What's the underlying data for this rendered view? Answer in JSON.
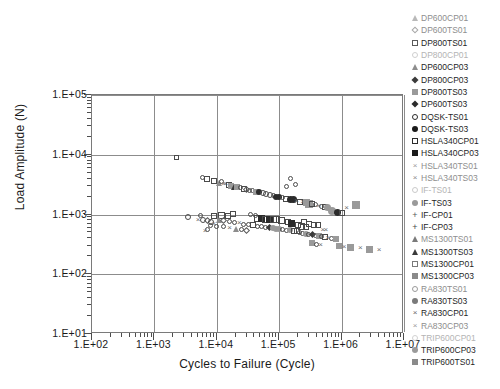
{
  "chart_data": {
    "type": "scatter",
    "title": "",
    "xlabel": "Cycles to Failure (Cycle)",
    "ylabel": "Load Amplitude (N)",
    "xscale": "log",
    "yscale": "log",
    "xlim": [
      100,
      10000000
    ],
    "ylim": [
      10,
      100000
    ],
    "xticks": [
      "1.E+02",
      "1.E+03",
      "1.E+04",
      "1.E+05",
      "1.E+06",
      "1.E+07"
    ],
    "yticks": [
      "1.E+01",
      "1.E+02",
      "1.E+03",
      "1.E+04",
      "1.E+05"
    ],
    "grid": true,
    "legend_position": "right-outside",
    "series": [
      {
        "name": "DP600CP01",
        "marker": "triangle-open",
        "color": "#b9b9b9"
      },
      {
        "name": "DP600TS01",
        "marker": "diamond-open",
        "color": "#a8a8a8"
      },
      {
        "name": "DP800TS01",
        "marker": "square-open",
        "color": "#5a5a5a"
      },
      {
        "name": "DP800CP01",
        "marker": "circle-open",
        "color": "#cfcfcf"
      },
      {
        "name": "DP600CP03",
        "marker": "triangle-filled",
        "color": "#8d8d8d"
      },
      {
        "name": "DP800CP03",
        "marker": "diamond-filled",
        "color": "#3a3a3a"
      },
      {
        "name": "DP800TS03",
        "marker": "square-gray",
        "color": "#9a9a9a"
      },
      {
        "name": "DP600TS03",
        "marker": "diamond-filled",
        "color": "#2b2b2b"
      },
      {
        "name": "DQSK-TS01",
        "marker": "circle-open",
        "color": "#2b2b2b"
      },
      {
        "name": "DQSK-TS03",
        "marker": "circle-filled",
        "color": "#1a1a1a"
      },
      {
        "name": "HSLA340CP01",
        "marker": "square-open",
        "color": "#2b2b2b"
      },
      {
        "name": "HSLA340CP03",
        "marker": "square-filled",
        "color": "#1a1a1a"
      },
      {
        "name": "HSLA340TS01",
        "marker": "x-mark",
        "color": "#9a9a9a"
      },
      {
        "name": "HSLA340TS03",
        "marker": "x-mark",
        "color": "#8a8a8a"
      },
      {
        "name": "IF-TS01",
        "marker": "circle-open",
        "color": "#cacaca"
      },
      {
        "name": "IF-TS03",
        "marker": "circle-gray",
        "color": "#9a9a9a"
      },
      {
        "name": "IF-CP01",
        "marker": "plus-mark",
        "color": "#5a5a5a"
      },
      {
        "name": "IF-CP03",
        "marker": "plus-mark",
        "color": "#4a4a4a"
      },
      {
        "name": "MS1300TS01",
        "marker": "triangle-open",
        "color": "#7a7a7a"
      },
      {
        "name": "MS1300TS03",
        "marker": "triangle-filled",
        "color": "#3a3a3a"
      },
      {
        "name": "MS1300CP01",
        "marker": "square-open",
        "color": "#7a7a7a"
      },
      {
        "name": "MS1300CP03",
        "marker": "square-gray",
        "color": "#8a8a8a"
      },
      {
        "name": "RA830TS01",
        "marker": "circle-open",
        "color": "#9a9a9a"
      },
      {
        "name": "RA830TS03",
        "marker": "circle-gray",
        "color": "#7a7a7a"
      },
      {
        "name": "RA830CP01",
        "marker": "x-mark",
        "color": "#6a6a6a"
      },
      {
        "name": "RA830CP03",
        "marker": "x-mark",
        "color": "#9a9a9a"
      },
      {
        "name": "TRIP600CP01",
        "marker": "circle-open",
        "color": "#d2d2d2"
      },
      {
        "name": "TRIP600CP03",
        "marker": "circle-gray",
        "color": "#9a9a9a"
      },
      {
        "name": "TRIP600TS01",
        "marker": "square-gray",
        "color": "#8a8a8a"
      }
    ],
    "clusters": [
      {
        "note": "upper band",
        "x_from": 3000,
        "x_to": 2000000,
        "y_from": 5000,
        "y_to": 900
      },
      {
        "note": "lower band",
        "x_from": 3000,
        "x_to": 7000000,
        "y_from": 900,
        "y_to": 90
      }
    ],
    "points": [
      [
        2300,
        9000,
        "m-sq-o",
        5
      ],
      [
        6000,
        4200,
        "m-ci-o",
        5
      ],
      [
        7000,
        4000,
        "m-sq-o",
        6
      ],
      [
        9000,
        3600,
        "m-sq-o",
        6
      ],
      [
        11000,
        3400,
        "m-tr-o",
        6
      ],
      [
        12000,
        3500,
        "m-ci-o",
        5
      ],
      [
        13000,
        3300,
        "m-x",
        6
      ],
      [
        14000,
        3200,
        "m-x",
        6
      ],
      [
        15500,
        3100,
        "m-sq-o",
        6
      ],
      [
        17000,
        3000,
        "m-sq-g",
        6
      ],
      [
        19000,
        2900,
        "m-tr-f",
        6
      ],
      [
        21000,
        2850,
        "m-sq-g",
        6
      ],
      [
        24000,
        2800,
        "m-ci-o",
        5
      ],
      [
        27000,
        2700,
        "m-sq-o",
        6
      ],
      [
        30000,
        2600,
        "m-di-o",
        5
      ],
      [
        34000,
        2550,
        "m-ci-o",
        5
      ],
      [
        38000,
        2500,
        "m-ci-o",
        5
      ],
      [
        43000,
        2400,
        "m-sq-g",
        6
      ],
      [
        48000,
        2350,
        "m-ci-f",
        6
      ],
      [
        55000,
        2300,
        "m-ci-o",
        6
      ],
      [
        62000,
        2200,
        "m-ci-o",
        6
      ],
      [
        70000,
        2150,
        "m-ci-o",
        6
      ],
      [
        80000,
        2050,
        "m-ci-o",
        5
      ],
      [
        90000,
        2000,
        "m-ci-f",
        6
      ],
      [
        100000,
        1950,
        "m-ci-f",
        6
      ],
      [
        115000,
        1900,
        "m-ci-o",
        5
      ],
      [
        130000,
        1850,
        "m-sq-o",
        6
      ],
      [
        150000,
        1800,
        "m-ci-f",
        7
      ],
      [
        170000,
        1750,
        "m-ci-f",
        7
      ],
      [
        190000,
        1700,
        "m-x",
        6
      ],
      [
        215000,
        1650,
        "m-sq-o",
        6
      ],
      [
        240000,
        1600,
        "m-x",
        6
      ],
      [
        270000,
        1580,
        "m-sq-g",
        7
      ],
      [
        300000,
        1520,
        "m-sq-g",
        8
      ],
      [
        340000,
        1480,
        "m-sq-o",
        6
      ],
      [
        380000,
        1450,
        "m-ci-o",
        5
      ],
      [
        430000,
        1400,
        "m-x",
        6
      ],
      [
        480000,
        1380,
        "m-ci-o",
        5
      ],
      [
        540000,
        1340,
        "m-sq-o",
        6
      ],
      [
        600000,
        1300,
        "m-ci-g",
        7
      ],
      [
        700000,
        1150,
        "m-ci-g",
        8
      ],
      [
        850000,
        1080,
        "m-ci-f",
        7
      ],
      [
        1000000,
        1040,
        "m-sq-o",
        6
      ],
      [
        1200000,
        1300,
        "m-x",
        6
      ],
      [
        1700000,
        1450,
        "m-sq-g",
        8
      ],
      [
        3500,
        900,
        "m-ci-o",
        6
      ],
      [
        5000,
        820,
        "m-x",
        6
      ],
      [
        6000,
        800,
        "m-ci-o",
        6
      ],
      [
        7000,
        780,
        "m-di-o",
        5
      ],
      [
        8000,
        760,
        "m-ci-o",
        6
      ],
      [
        9000,
        700,
        "m-x",
        6
      ],
      [
        5500,
        980,
        "m-ci-o",
        5
      ],
      [
        9000,
        950,
        "m-sq-o",
        6
      ],
      [
        12000,
        960,
        "m-sq-o",
        7
      ],
      [
        15000,
        950,
        "m-sq-o",
        6
      ],
      [
        11000,
        820,
        "m-tr-o",
        6
      ],
      [
        13000,
        800,
        "m-di-o",
        5
      ],
      [
        16000,
        760,
        "m-ci-o",
        5
      ],
      [
        19000,
        740,
        "m-ci-o",
        5
      ],
      [
        23000,
        700,
        "m-x",
        7
      ],
      [
        27000,
        690,
        "m-ci-o",
        5
      ],
      [
        32000,
        670,
        "m-ci-o",
        5
      ],
      [
        38000,
        660,
        "m-sq-o",
        6
      ],
      [
        45000,
        870,
        "m-sq-o",
        7
      ],
      [
        52000,
        850,
        "m-sq-f",
        7
      ],
      [
        60000,
        840,
        "m-sq-o",
        7
      ],
      [
        70000,
        830,
        "m-sq-f",
        7
      ],
      [
        80000,
        820,
        "m-sq-o",
        7
      ],
      [
        90000,
        810,
        "m-sq-o",
        7
      ],
      [
        45000,
        640,
        "m-ci-o",
        5
      ],
      [
        52000,
        620,
        "m-ci-o",
        5
      ],
      [
        60000,
        610,
        "m-ci-o",
        5
      ],
      [
        70000,
        600,
        "m-di-f",
        5
      ],
      [
        80000,
        590,
        "m-ci-g",
        6
      ],
      [
        90000,
        580,
        "m-ci-g",
        6
      ],
      [
        100000,
        570,
        "m-ci-g",
        6
      ],
      [
        115000,
        560,
        "m-ci-o",
        5
      ],
      [
        130000,
        550,
        "m-ci-o",
        5
      ],
      [
        150000,
        540,
        "m-ci-g",
        6
      ],
      [
        170000,
        530,
        "m-sq-o",
        6
      ],
      [
        190000,
        520,
        "m-sq-o",
        6
      ],
      [
        110000,
        790,
        "m-sq-o",
        7
      ],
      [
        140000,
        760,
        "m-sq-o",
        6
      ],
      [
        160000,
        700,
        "m-sq-f",
        7
      ],
      [
        200000,
        660,
        "m-sq-o",
        6
      ],
      [
        230000,
        640,
        "m-sq-o",
        7
      ],
      [
        270000,
        620,
        "m-sq-o",
        6
      ],
      [
        215000,
        500,
        "m-ci-o",
        5
      ],
      [
        240000,
        490,
        "m-ci-o",
        5
      ],
      [
        270000,
        480,
        "m-ci-g",
        6
      ],
      [
        300000,
        470,
        "m-ci-o",
        5
      ],
      [
        340000,
        460,
        "m-di-f",
        5
      ],
      [
        380000,
        450,
        "m-ci-o",
        5
      ],
      [
        430000,
        440,
        "m-sq-g",
        6
      ],
      [
        480000,
        430,
        "m-ci-o",
        5
      ],
      [
        540000,
        420,
        "m-sq-o",
        6
      ],
      [
        600000,
        410,
        "m-x",
        6
      ],
      [
        700000,
        400,
        "m-ci-o",
        5
      ],
      [
        800000,
        390,
        "m-sq-g",
        6
      ],
      [
        900000,
        300,
        "m-sq-g",
        6
      ],
      [
        1100000,
        290,
        "m-x",
        6
      ],
      [
        1400000,
        280,
        "m-sq-g",
        7
      ],
      [
        2000000,
        270,
        "m-x",
        6
      ],
      [
        2800000,
        260,
        "m-sq-g",
        7
      ],
      [
        4000000,
        250,
        "m-x",
        6
      ],
      [
        330000,
        330,
        "m-sq-g",
        6
      ],
      [
        400000,
        320,
        "m-ci-o",
        5
      ],
      [
        460000,
        310,
        "m-x",
        6
      ],
      [
        25000,
        560,
        "m-ci-o",
        5
      ],
      [
        30000,
        545,
        "m-di-o",
        5
      ],
      [
        20000,
        580,
        "m-tr-o",
        6
      ],
      [
        16000,
        600,
        "m-x",
        6
      ],
      [
        13000,
        620,
        "m-ci-o",
        5
      ],
      [
        10000,
        640,
        "m-ci-o",
        5
      ],
      [
        8000,
        660,
        "m-ci-o",
        5
      ],
      [
        7000,
        560,
        "m-ci-o",
        5
      ],
      [
        6500,
        520,
        "m-x",
        6
      ],
      [
        35000,
        1000,
        "m-ci-o",
        5
      ],
      [
        42000,
        980,
        "m-ci-o",
        5
      ],
      [
        18000,
        1020,
        "m-sq-o",
        6
      ],
      [
        250000,
        760,
        "m-sq-o",
        6
      ],
      [
        300000,
        700,
        "m-sq-o",
        6
      ],
      [
        360000,
        680,
        "m-sq-o",
        6
      ],
      [
        420000,
        660,
        "m-sq-o",
        6
      ],
      [
        500000,
        560,
        "m-x",
        6
      ],
      [
        560000,
        540,
        "m-x",
        6
      ],
      [
        150000,
        4000,
        "m-ci-o",
        5
      ],
      [
        180000,
        3200,
        "m-ci-o",
        5
      ],
      [
        130000,
        2900,
        "m-ci-o",
        5
      ]
    ]
  }
}
